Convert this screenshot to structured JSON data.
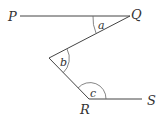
{
  "diagram": {
    "type": "geometry-angles",
    "points": {
      "P": {
        "label": "P"
      },
      "Q": {
        "label": "Q"
      },
      "R": {
        "label": "R"
      },
      "S": {
        "label": "S"
      }
    },
    "angles": {
      "a": {
        "label": "a"
      },
      "b": {
        "label": "b"
      },
      "c": {
        "label": "c"
      }
    },
    "colors": {
      "line": "#444444",
      "text": "#333333",
      "background": "#ffffff"
    }
  }
}
